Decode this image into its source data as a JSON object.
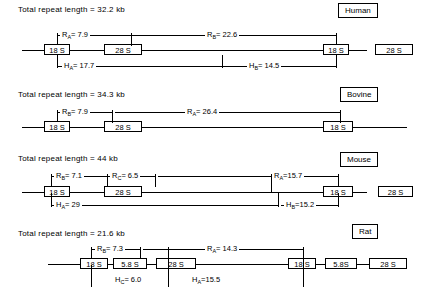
{
  "figure": {
    "type": "rdna-repeat-unit-maps",
    "units": "kb"
  },
  "panels": [
    {
      "id": "human",
      "species_label": "Human",
      "repeat_title": "Total repeat length = 32.2 kb",
      "genes": [
        {
          "label": "18 S"
        },
        {
          "label": "28 S"
        },
        {
          "label": "18 S"
        },
        {
          "label": "28 S"
        }
      ],
      "measurements_above": [
        {
          "name": "R",
          "sub": "A",
          "value": "7.9",
          "text": "Rₐ= 7.9"
        },
        {
          "name": "R",
          "sub": "B",
          "value": "22.6",
          "text": "Rᵦ= 22.6"
        }
      ],
      "measurements_below": [
        {
          "name": "H",
          "sub": "A",
          "value": "17.7",
          "text": "Hₐ= 17.7"
        },
        {
          "name": "H",
          "sub": "B",
          "value": "14.5",
          "text": "Hᵦ= 14.5"
        }
      ]
    },
    {
      "id": "bovine",
      "species_label": "Bovine",
      "repeat_title": "Total repeat length = 34.3 kb",
      "genes": [
        {
          "label": "18 S"
        },
        {
          "label": "28 S"
        },
        {
          "label": "18 S"
        }
      ],
      "measurements_above": [
        {
          "name": "R",
          "sub": "B",
          "value": "7.9",
          "text": "Rᵦ= 7.9"
        },
        {
          "name": "R",
          "sub": "A",
          "value": "26.4",
          "text": "Rₐ= 26.4"
        }
      ],
      "measurements_below": []
    },
    {
      "id": "mouse",
      "species_label": "Mouse",
      "repeat_title": "Total repeat length = 44 kb",
      "genes": [
        {
          "label": "18 S"
        },
        {
          "label": "28 S"
        },
        {
          "label": "18 S"
        },
        {
          "label": "28 S"
        }
      ],
      "measurements_above": [
        {
          "name": "R",
          "sub": "B",
          "value": "7.1",
          "text": "Rᵦ= 7.1"
        },
        {
          "name": "R",
          "sub": "C",
          "value": "6.5",
          "text": "Rᶜ= 6.5"
        },
        {
          "name": "R",
          "sub": "A",
          "value": "15.7",
          "text": "Rₐ=15.7"
        }
      ],
      "measurements_below": [
        {
          "name": "H",
          "sub": "A",
          "value": "29",
          "text": "Hₐ= 29"
        },
        {
          "name": "H",
          "sub": "B",
          "value": "15.2",
          "text": "Hᵦ=15.2"
        }
      ]
    },
    {
      "id": "rat",
      "species_label": "Rat",
      "repeat_title": "Total repeat length = 21.6 kb",
      "genes": [
        {
          "label": "18 S"
        },
        {
          "label": "5.8 S"
        },
        {
          "label": "28 S"
        },
        {
          "label": "18 S"
        },
        {
          "label": "5.8S"
        },
        {
          "label": "28 S"
        }
      ],
      "measurements_above": [
        {
          "name": "R",
          "sub": "B",
          "value": "7.3",
          "text": "Rᵦ= 7.3"
        },
        {
          "name": "R",
          "sub": "A",
          "value": "14.3",
          "text": "Rₐ= 14.3"
        }
      ],
      "measurements_below": [
        {
          "name": "H",
          "sub": "C",
          "value": "6.0",
          "text": "Hᶜ= 6.0"
        },
        {
          "name": "H",
          "sub": "A",
          "value": "15.5",
          "text": "Hₐ=15.5"
        }
      ]
    }
  ],
  "labels": {
    "human": {
      "title": "Total repeat length = 32.2 kb",
      "tag": "Human",
      "g0": "18 S",
      "g1": "28 S",
      "g2": "18 S",
      "g3": "28 S",
      "ra": "R",
      "ra_sub": "A",
      "ra_val": "= 7.9",
      "rb": "R",
      "rb_sub": "B",
      "rb_val": "= 22.6",
      "ha": "H",
      "ha_sub": "A",
      "ha_val": "= 17.7",
      "hb": "H",
      "hb_sub": "B",
      "hb_val": "= 14.5"
    },
    "bovine": {
      "title": "Total repeat length = 34.3 kb",
      "tag": "Bovine",
      "g0": "18 S",
      "g1": "28 S",
      "g2": "18 S",
      "rb": "R",
      "rb_sub": "B",
      "rb_val": "= 7.9",
      "ra": "R",
      "ra_sub": "A",
      "ra_val": "= 26.4"
    },
    "mouse": {
      "title": "Total repeat length = 44 kb",
      "tag": "Mouse",
      "g0": "18 S",
      "g1": "28 S",
      "g2": "18 S",
      "g3": "28 S",
      "rb": "R",
      "rb_sub": "B",
      "rb_val": "= 7.1",
      "rc": "R",
      "rc_sub": "C",
      "rc_val": "= 6.5",
      "ra": "R",
      "ra_sub": "A",
      "ra_val": "=15.7",
      "ha": "H",
      "ha_sub": "A",
      "ha_val": "= 29",
      "hb": "H",
      "hb_sub": "B",
      "hb_val": "=15.2"
    },
    "rat": {
      "title": "Total repeat length = 21.6 kb",
      "tag": "Rat",
      "g0": "18 S",
      "g1": "5.8 S",
      "g2": "28 S",
      "g3": "18 S",
      "g4": "5.8S",
      "g5": "28 S",
      "rb": "R",
      "rb_sub": "B",
      "rb_val": "= 7.3",
      "ra": "R",
      "ra_sub": "A",
      "ra_val": "= 14.3",
      "hc": "H",
      "hc_sub": "C",
      "hc_val": "= 6.0",
      "ha": "H",
      "ha_sub": "A",
      "ha_val": "=15.5"
    }
  }
}
